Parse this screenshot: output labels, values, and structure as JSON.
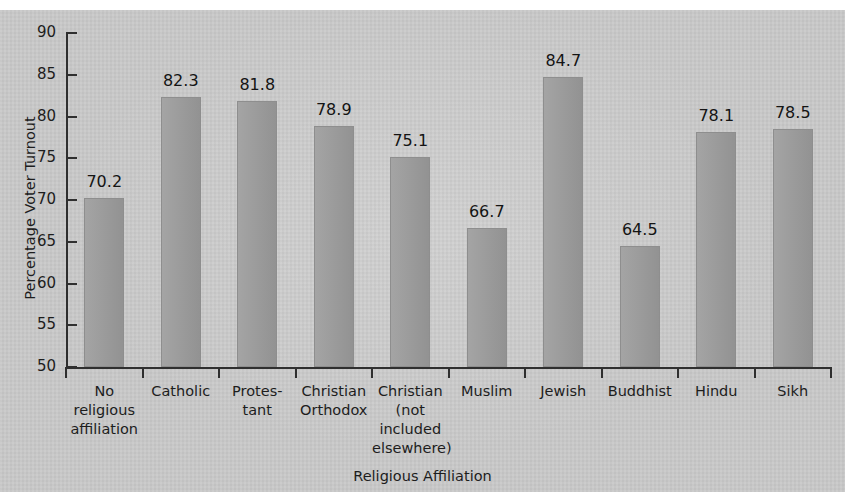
{
  "figure": {
    "background_color": "#c8c8c8",
    "bar_color": "#9a9a9a",
    "axis_color": "#2f2f2f",
    "text_color": "#1d1d1d"
  },
  "chart_data": {
    "type": "bar",
    "title": "",
    "xlabel": "Religious Affiliation",
    "ylabel": "Percentage Voter Turnout",
    "ylim": [
      50,
      90
    ],
    "yticks": [
      50,
      55,
      60,
      65,
      70,
      75,
      80,
      85,
      90
    ],
    "ytick_labels": [
      "50",
      "55",
      "60",
      "65",
      "70",
      "75",
      "80",
      "85",
      "90"
    ],
    "grid": false,
    "legend": "none",
    "categories": [
      "No religious affiliation",
      "Catholic",
      "Protestant",
      "Christian Orthodox",
      "Christian (not included elsewhere)",
      "Muslim",
      "Jewish",
      "Buddhist",
      "Hindu",
      "Sikh"
    ],
    "category_label_lines": [
      [
        "No",
        "religious",
        "affiliation"
      ],
      [
        "Catholic"
      ],
      [
        "Protes-",
        "tant"
      ],
      [
        "Christian",
        "Orthodox"
      ],
      [
        "Christian",
        "(not",
        "included",
        "elsewhere)"
      ],
      [
        "Muslim"
      ],
      [
        "Jewish"
      ],
      [
        "Buddhist"
      ],
      [
        "Hindu"
      ],
      [
        "Sikh"
      ]
    ],
    "values": [
      70.2,
      82.3,
      81.8,
      78.9,
      75.1,
      66.7,
      84.7,
      64.5,
      78.1,
      78.5
    ],
    "value_labels": [
      "70.2",
      "82.3",
      "81.8",
      "78.9",
      "75.1",
      "66.7",
      "84.7",
      "64.5",
      "78.1",
      "78.5"
    ]
  }
}
